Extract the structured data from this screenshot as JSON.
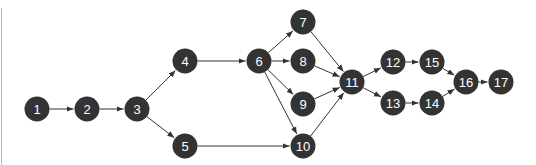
{
  "diagram": {
    "type": "directed-network",
    "node_color": "#333333",
    "label_color": "#ffffff",
    "edge_color": "#333333",
    "nodes": [
      {
        "id": "1",
        "label": "1",
        "x": 37,
        "y": 109
      },
      {
        "id": "2",
        "label": "2",
        "x": 87,
        "y": 109
      },
      {
        "id": "3",
        "label": "3",
        "x": 137,
        "y": 109
      },
      {
        "id": "4",
        "label": "4",
        "x": 185,
        "y": 61
      },
      {
        "id": "5",
        "label": "5",
        "x": 185,
        "y": 146
      },
      {
        "id": "6",
        "label": "6",
        "x": 259,
        "y": 61
      },
      {
        "id": "7",
        "label": "7",
        "x": 303,
        "y": 22
      },
      {
        "id": "8",
        "label": "8",
        "x": 303,
        "y": 61
      },
      {
        "id": "9",
        "label": "9",
        "x": 303,
        "y": 104
      },
      {
        "id": "10",
        "label": "10",
        "x": 303,
        "y": 146
      },
      {
        "id": "11",
        "label": "11",
        "x": 352,
        "y": 82
      },
      {
        "id": "12",
        "label": "12",
        "x": 393,
        "y": 62
      },
      {
        "id": "13",
        "label": "13",
        "x": 393,
        "y": 103
      },
      {
        "id": "14",
        "label": "14",
        "x": 432,
        "y": 103
      },
      {
        "id": "15",
        "label": "15",
        "x": 432,
        "y": 62
      },
      {
        "id": "16",
        "label": "16",
        "x": 466,
        "y": 82
      },
      {
        "id": "17",
        "label": "17",
        "x": 501,
        "y": 82
      }
    ],
    "edges": [
      [
        "1",
        "2"
      ],
      [
        "2",
        "3"
      ],
      [
        "3",
        "4"
      ],
      [
        "3",
        "5"
      ],
      [
        "4",
        "6"
      ],
      [
        "5",
        "10"
      ],
      [
        "6",
        "7"
      ],
      [
        "6",
        "8"
      ],
      [
        "6",
        "9"
      ],
      [
        "6",
        "10"
      ],
      [
        "7",
        "11"
      ],
      [
        "8",
        "11"
      ],
      [
        "9",
        "11"
      ],
      [
        "10",
        "11"
      ],
      [
        "11",
        "12"
      ],
      [
        "11",
        "13"
      ],
      [
        "12",
        "15"
      ],
      [
        "13",
        "14"
      ],
      [
        "15",
        "16"
      ],
      [
        "14",
        "16"
      ],
      [
        "16",
        "17"
      ]
    ]
  }
}
